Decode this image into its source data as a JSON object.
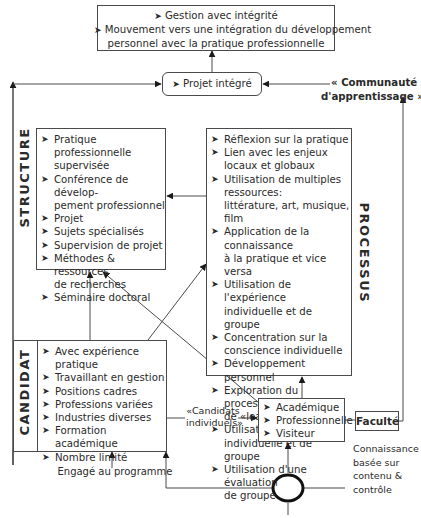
{
  "top_box": {
    "items": [
      "Gestion avec intégrité",
      "Mouvement vers une intégration du développement personnel avec la pratique professionnelle"
    ],
    "line1": "Gestion avec intégrité",
    "line2": "Mouvement vers une intégration du développement",
    "line3": "personnel avec la pratique professionnelle"
  },
  "projet": {
    "label": "Projet intégré"
  },
  "communaute": {
    "line1": "« Communauté",
    "line2": "d'apprentissage »"
  },
  "structure": {
    "label": "STRUCTURE",
    "items": [
      "Pratique professionnelle supervisée",
      "Conférence de développement professionnel",
      "Projet",
      "Sujets spécialisés",
      "Supervision de projet",
      "Méthodes & ressources de recherches",
      "Séminaire doctoral"
    ],
    "lines": [
      [
        "Pratique professionnelle",
        "supervisée"
      ],
      [
        "Conférence de dévelop-",
        "pement professionnel"
      ],
      [
        "Projet"
      ],
      [
        "Sujets spécialisés"
      ],
      [
        "Supervision de projet"
      ],
      [
        "Méthodes & ressources",
        "de recherches"
      ],
      [
        "Séminaire doctoral"
      ]
    ]
  },
  "processus": {
    "label": "PROCESSUS",
    "items": [
      "Réflexion sur la pratique",
      "Lien avec les enjeux locaux et globaux",
      "Utilisation de multiples ressources: littérature, art, musique, film",
      "Application de la connaissance à la pratique et vice versa",
      "Utilisation de l'expérience individuelle et de groupe",
      "Concentration sur la conscience individuelle",
      "Développement personnel",
      "Exploration du processus de «leading managing»",
      "Utilisation de séance individuelle et de groupe",
      "Utilisation d'une évaluation de groupe"
    ],
    "lines": [
      [
        "Réflexion sur la pratique"
      ],
      [
        "Lien avec les enjeux",
        "locaux et globaux"
      ],
      [
        "Utilisation de multiples ressources:",
        "littérature, art, musique, film"
      ],
      [
        "Application de la connaissance",
        "à la pratique et vice versa"
      ],
      [
        "Utilisation de l'expérience",
        "individuelle et de groupe"
      ],
      [
        "Concentration sur la",
        "conscience individuelle"
      ],
      [
        "Développement personnel"
      ],
      [
        "Exploration du processus",
        "de «leading managing»"
      ],
      [
        "Utilisation de séance",
        "individuelle et de groupe"
      ],
      [
        "Utilisation d'une évaluation",
        "de groupe"
      ]
    ]
  },
  "candidat": {
    "label": "CANDIDAT",
    "items": [
      "Avec expérience pratique",
      "Travaillant en gestion",
      "Positions cadres",
      "Professions variées",
      "Industries diverses",
      "Formation académique",
      "Nombre limité"
    ]
  },
  "candidats_individuels": {
    "line1": "«Candidats",
    "line2": "individuels»"
  },
  "participants": {
    "items": [
      "Académique",
      "Professionnelle",
      "Visiteur"
    ]
  },
  "faculte": {
    "label": "Faculté"
  },
  "connaissance": {
    "lines": [
      "Connaissance",
      "basée sur",
      "contenu &",
      "contrôle"
    ]
  },
  "engage": {
    "label": "Engagé au programme"
  },
  "bullet": "➤",
  "colors": {
    "line": "#4a4a4a",
    "text": "#2a2a2a",
    "background": "#ffffff"
  }
}
